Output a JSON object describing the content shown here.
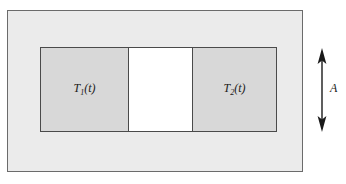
{
  "figure": {
    "outer_enclosure": {
      "name": "ambient enclosure",
      "fill_color": "#ebebeb",
      "border_color": "#6b6b6b"
    },
    "bodies": [
      {
        "id": "body-left",
        "label_main": "T",
        "label_sub": "1",
        "label_arg": "(t)",
        "label_text": "T₁(t)",
        "fill_color": "#d8d8d8",
        "border_color": "#4a4a4a"
      },
      {
        "id": "body-right",
        "label_main": "T",
        "label_sub": "2",
        "label_arg": "(t)",
        "label_text": "T₂(t)",
        "fill_color": "#d8d8d8",
        "border_color": "#4a4a4a"
      }
    ],
    "gap": {
      "name": "separating gap",
      "fill_color": "#ffffff",
      "border_color": "#4a4a4a"
    },
    "dimension": {
      "label": "A",
      "arrow_style": "double-headed-vertical",
      "color": "#1a1a1a"
    }
  }
}
